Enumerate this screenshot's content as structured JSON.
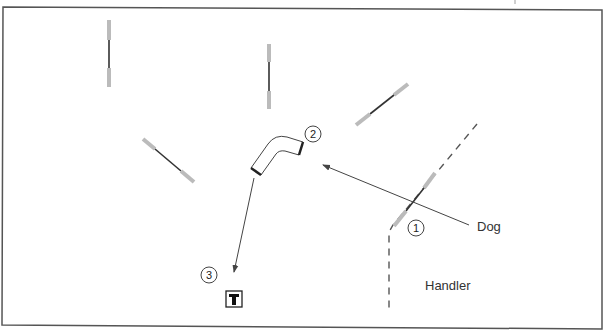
{
  "diagram": {
    "type": "agility-course-map",
    "colors": {
      "border": "#555555",
      "bar": "#333333",
      "wing": "#bbbbbb",
      "path": "#444444",
      "handler_line": "#555555"
    },
    "labels": {
      "dog": "Dog",
      "handler": "Handler"
    },
    "obstacles": [
      {
        "id": "jump-1",
        "kind": "jump",
        "number": "1"
      },
      {
        "id": "tunnel-2",
        "kind": "tunnel",
        "number": "2"
      },
      {
        "id": "table-3",
        "kind": "table",
        "number": "3",
        "symbol": "T"
      },
      {
        "id": "jump-a",
        "kind": "jump"
      },
      {
        "id": "jump-b",
        "kind": "jump"
      },
      {
        "id": "jump-c",
        "kind": "jump"
      },
      {
        "id": "jump-d",
        "kind": "jump"
      }
    ],
    "paths": [
      {
        "id": "dog-path-1",
        "from": "dog-start",
        "to": "tunnel-2"
      },
      {
        "id": "dog-path-2",
        "from": "tunnel-2",
        "to": "table-3"
      },
      {
        "id": "handler-line",
        "style": "dashed"
      }
    ]
  }
}
